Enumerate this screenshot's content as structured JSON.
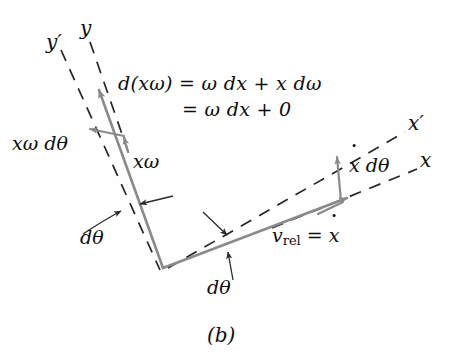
{
  "figure": {
    "caption": "(b)",
    "type": "vector-diagram",
    "background_color": "#fefefe",
    "vector_color": "#8a8a8a",
    "dash_color": "#262626",
    "text_color": "#0d0d0d"
  },
  "axes": [
    {
      "name": "y-prime-axis",
      "label": "y′",
      "style": "dashed",
      "x": 52,
      "y": 32
    },
    {
      "name": "y-axis",
      "label": "y",
      "style": "dashed",
      "x": 86,
      "y": 22
    },
    {
      "name": "x-prime-axis",
      "label": "x′",
      "style": "dashed",
      "x": 412,
      "y": 121
    },
    {
      "name": "x-axis",
      "label": "x",
      "style": "dashed",
      "x": 423,
      "y": 158
    }
  ],
  "equation": {
    "line1_lhs": "d(xω)",
    "line1_rhs": "= ω dx + x dω",
    "line1_full": "d(xω) = ω dx + x dω",
    "line2_full": "= ω dx + 0"
  },
  "labels": {
    "x_omega_dtheta": "xω dθ",
    "x_omega": "xω",
    "dtheta_left": "dθ",
    "dtheta_bottom": "dθ",
    "xdot_dtheta_pre": "",
    "xdot_dtheta_dot": "x",
    "xdot_dtheta_post": " dθ",
    "v_rel_sym": "v",
    "v_rel_sub": "rel",
    "v_rel_eq": " = ",
    "v_rel_val": "x"
  },
  "vectors": [
    {
      "name": "x-omega-vector",
      "from": [
        163,
        268
      ],
      "to": [
        98,
        88
      ],
      "label": "xω"
    },
    {
      "name": "v-rel-vector",
      "from": [
        163,
        268
      ],
      "to": [
        348,
        197
      ],
      "label": "v_rel = xdot"
    },
    {
      "name": "x-omega-dtheta-vector",
      "from": [
        122,
        133
      ],
      "to": [
        88,
        128
      ],
      "label": "xω dθ"
    },
    {
      "name": "xdot-dtheta-vector",
      "from": [
        340,
        200
      ],
      "to": [
        336,
        155
      ],
      "label": "xdot dθ"
    }
  ]
}
